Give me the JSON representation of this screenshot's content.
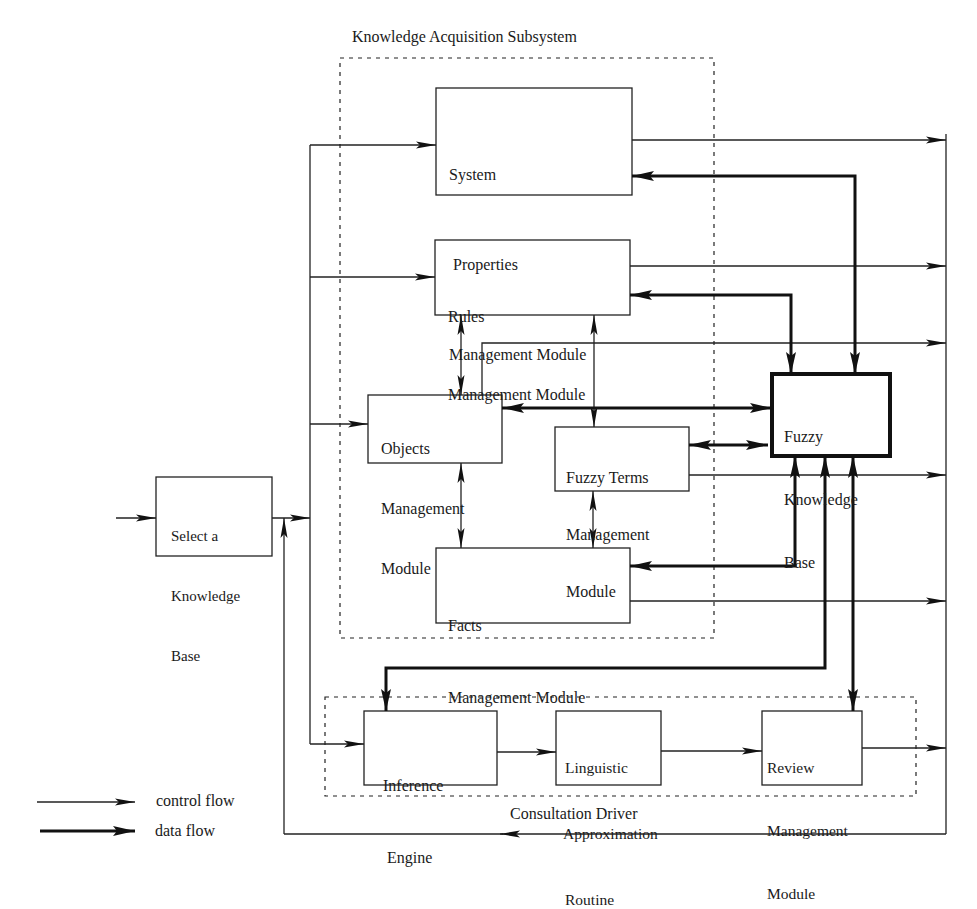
{
  "diagram": {
    "groups": {
      "knowledge_acquisition": "Knowledge Acquisition Subsystem",
      "consultation_driver": "Consultation Driver"
    },
    "modules": {
      "select_kb": [
        "Select a",
        "Knowledge",
        "Base"
      ],
      "system_properties": [
        "System",
        "Properties",
        "Management Module"
      ],
      "rules": [
        "Rules",
        "Management Module"
      ],
      "objects": [
        "Objects",
        "Management",
        "Module"
      ],
      "fuzzy_terms": [
        "Fuzzy Terms",
        "Management",
        "Module"
      ],
      "facts": [
        "Facts",
        "Management Module"
      ],
      "fuzzy_kb": [
        "Fuzzy",
        "Knowledge",
        "Base"
      ],
      "inference_engine": [
        "Inference",
        "Engine"
      ],
      "linguistic_approx": [
        "Linguistic",
        "Approximation",
        "Routine"
      ],
      "review": [
        "Review",
        "Management",
        "Module"
      ]
    },
    "legend": {
      "control_flow": "control flow",
      "data_flow": "data flow"
    }
  }
}
